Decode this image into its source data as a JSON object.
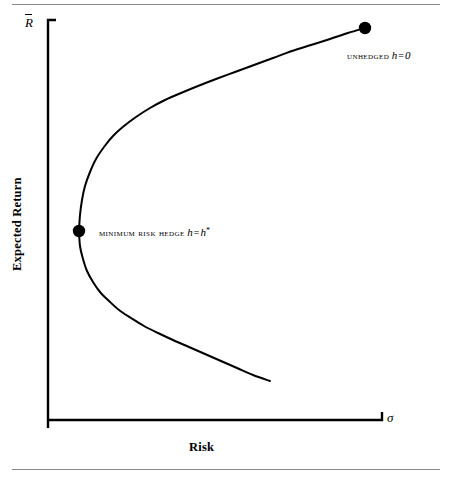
{
  "figure": {
    "width": 449,
    "height": 479,
    "background": "#ffffff",
    "rule_color": "#8a8a8a",
    "ink_color": "#000000"
  },
  "axes": {
    "y_symbol_letter": "R",
    "y_symbol_full": "R̄",
    "y_title": "Expected Return",
    "x_symbol": "σ",
    "x_title": "Risk",
    "y_axis_x": 48,
    "y_axis_top": 20,
    "y_axis_bottom": 428,
    "x_axis_y": 420,
    "x_axis_left": 48,
    "x_axis_right": 382,
    "cap_length": 8,
    "line_width": 2.4
  },
  "annotations": [
    {
      "id": "unhedged",
      "name": "unhedged-point-label",
      "text_caps": "UNHEDGED",
      "var": "h",
      "eq": "=",
      "value": "0",
      "star": "",
      "point_x": 365,
      "point_y": 28,
      "dot_radius": 6.2,
      "label_x": 347,
      "label_y": 49
    },
    {
      "id": "minimum-risk-hedge",
      "name": "minimum-risk-hedge-point-label",
      "text_caps": "MINIMUM RISK HEDGE",
      "var": "h",
      "eq": "=",
      "value": "h",
      "star": "*",
      "point_x": 79,
      "point_y": 231,
      "dot_radius": 6.2,
      "label_x": 99,
      "label_y": 226
    }
  ],
  "chart_data": {
    "type": "line",
    "title": "",
    "subtitle": "",
    "xlabel": "Risk",
    "ylabel": "Expected Return",
    "xlabel_symbol": "σ",
    "ylabel_symbol": "R̄",
    "grid": false,
    "legend": "none",
    "axis_ticks": "none",
    "xlim": [
      48,
      382
    ],
    "ylim": [
      420,
      20
    ],
    "series": [
      {
        "name": "efficient-frontier-upper-branch",
        "comment": "from minimum-risk vertex up-right to unhedged endpoint",
        "points": [
          [
            79,
            231
          ],
          [
            80,
            215
          ],
          [
            82,
            200
          ],
          [
            85,
            186
          ],
          [
            90,
            172
          ],
          [
            96,
            159
          ],
          [
            104,
            147
          ],
          [
            113,
            136
          ],
          [
            124,
            126
          ],
          [
            136,
            117
          ],
          [
            150,
            108
          ],
          [
            165,
            100
          ],
          [
            181,
            93
          ],
          [
            198,
            86
          ],
          [
            216,
            79
          ],
          [
            235,
            72
          ],
          [
            254,
            65
          ],
          [
            273,
            58
          ],
          [
            292,
            51
          ],
          [
            311,
            45
          ],
          [
            330,
            39
          ],
          [
            348,
            33
          ],
          [
            365,
            28
          ]
        ]
      },
      {
        "name": "efficient-frontier-lower-branch",
        "comment": "from minimum-risk vertex down-right to open end",
        "points": [
          [
            79,
            231
          ],
          [
            80,
            246
          ],
          [
            83,
            259
          ],
          [
            87,
            271
          ],
          [
            93,
            282
          ],
          [
            100,
            292
          ],
          [
            109,
            301
          ],
          [
            119,
            310
          ],
          [
            131,
            318
          ],
          [
            144,
            326
          ],
          [
            158,
            333
          ],
          [
            173,
            340
          ],
          [
            189,
            347
          ],
          [
            205,
            354
          ],
          [
            221,
            361
          ],
          [
            237,
            368
          ],
          [
            253,
            375
          ],
          [
            270,
            381
          ]
        ]
      }
    ],
    "markers": [
      {
        "label": "UNHEDGED h = 0",
        "x": 365,
        "y": 28
      },
      {
        "label": "MINIMUM RISK HEDGE h = h*",
        "x": 79,
        "y": 231
      }
    ]
  }
}
